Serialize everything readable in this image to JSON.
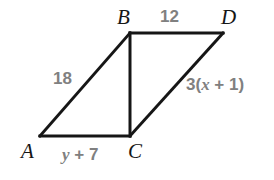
{
  "diagram": {
    "type": "geometry-figure",
    "shape": "parallelogram-with-diagonal",
    "background_color": "#ffffff",
    "stroke_color": "#161616",
    "stroke_width": 3,
    "vertex_label_color": "#161616",
    "measure_label_color": "#808080",
    "vertices": [
      {
        "name": "A",
        "label": "A",
        "x": 40,
        "y": 136
      },
      {
        "name": "B",
        "label": "B",
        "x": 130,
        "y": 33
      },
      {
        "name": "C",
        "label": "C",
        "x": 130,
        "y": 136
      },
      {
        "name": "D",
        "label": "D",
        "x": 223,
        "y": 33
      }
    ],
    "edges": [
      {
        "name": "AB",
        "from": "A",
        "to": "B"
      },
      {
        "name": "BD",
        "from": "B",
        "to": "D"
      },
      {
        "name": "BC",
        "from": "B",
        "to": "C"
      },
      {
        "name": "CD",
        "from": "C",
        "to": "D"
      },
      {
        "name": "AC",
        "from": "A",
        "to": "C"
      }
    ],
    "measures": {
      "side_AB": "18",
      "side_BD": "12",
      "side_CD_prefix": "3(",
      "side_CD_var": "x",
      "side_CD_suffix": " + 1)",
      "side_AC_var": "y",
      "side_AC_suffix": " + 7"
    }
  }
}
